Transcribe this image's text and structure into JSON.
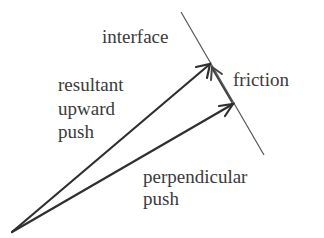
{
  "diagram": {
    "labels": {
      "interface": "interface",
      "friction": "friction",
      "resultant_line1": "resultant",
      "resultant_line2": "upward",
      "resultant_line3": "push",
      "perpendicular_line1": "perpendicular",
      "perpendicular_line2": "push"
    },
    "colors": {
      "arrow": "#2f2f2f",
      "interface_line": "#555555",
      "text": "#3a3a3a",
      "background": "#ffffff"
    }
  }
}
